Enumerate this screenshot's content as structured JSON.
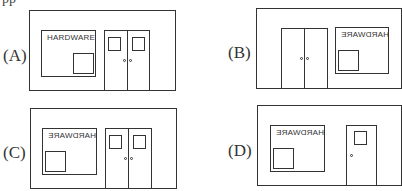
{
  "header": {
    "cut_text": "pp"
  },
  "options": [
    {
      "label": "(A)",
      "sign_text": "HARDWARE",
      "sign_mirrored": false,
      "window_side": "left",
      "door_type": "double",
      "pane_position": "bottom-right"
    },
    {
      "label": "(B)",
      "sign_text": "HARDWARE",
      "sign_mirrored": true,
      "window_side": "right",
      "door_type": "double",
      "pane_position": "bottom-left"
    },
    {
      "label": "(C)",
      "sign_text": "HARDWARE",
      "sign_mirrored": true,
      "window_side": "left",
      "door_type": "double",
      "pane_position": "bottom-left"
    },
    {
      "label": "(D)",
      "sign_text": "HARDWARE",
      "sign_mirrored": true,
      "window_side": "left",
      "door_type": "single",
      "pane_position": "bottom-left"
    }
  ]
}
